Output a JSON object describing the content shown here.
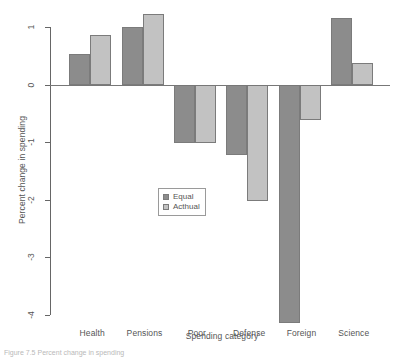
{
  "chart_data": {
    "type": "bar",
    "title": "",
    "xlabel": "Spending category",
    "ylabel": "Percent change in spending",
    "categories": [
      "Health",
      "Pensions",
      "Poor",
      "Defense",
      "Foreign",
      "Science"
    ],
    "series": [
      {
        "name": "Equal",
        "color": "#8c8c8c",
        "values": [
          0.53,
          1.0,
          -1.02,
          -1.22,
          -4.14,
          1.15
        ]
      },
      {
        "name": "Acthual",
        "color": "#c2c2c2",
        "values": [
          0.86,
          1.22,
          -1.02,
          -2.02,
          -0.62,
          0.37
        ]
      }
    ],
    "ylim": [
      -4,
      1
    ],
    "yticks": [
      1,
      0,
      -1,
      -2,
      -3,
      -4
    ],
    "ytick_labels": [
      "1",
      "0",
      "-1",
      "-2",
      "-3",
      "-4"
    ],
    "grid": false,
    "legend_position": "center-left-inside",
    "legend_entries": [
      "Equal",
      "Acthual"
    ],
    "zero_reference_line": 0
  },
  "caption": "Figure 7.5  Percent change in spending",
  "colors": {
    "bar_equal": "#8c8c8c",
    "bar_actual": "#c2c2c2",
    "axis": "#666666",
    "text": "#555555",
    "background": "#ffffff"
  }
}
